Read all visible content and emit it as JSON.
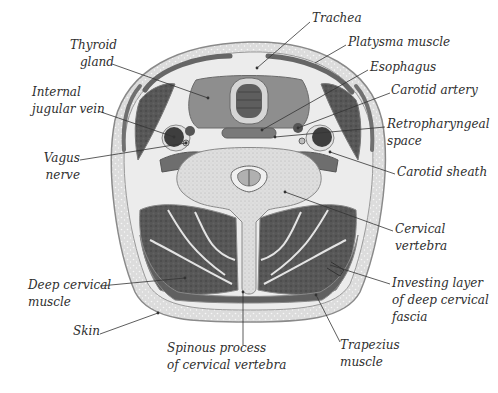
{
  "figure": {
    "colors": {
      "skin": "#cfcfcf",
      "fat": "#e6e6e6",
      "muscle_dark": "#555555",
      "muscle_mid": "#7a7a7a",
      "fascia": "#f2f2f2",
      "bone": "#d9d9d9",
      "outline": "#8a8a8a",
      "label_text": "#2e2e2e",
      "leader_line": "#333333"
    }
  },
  "labels": {
    "trachea": {
      "lines": [
        "Trachea"
      ]
    },
    "thyroid_gland": {
      "lines": [
        "Thyroid",
        "gland"
      ]
    },
    "platysma_muscle": {
      "lines": [
        "Platysma muscle"
      ]
    },
    "esophagus": {
      "lines": [
        "Esophagus"
      ]
    },
    "internal_jugular_vein": {
      "lines": [
        "Internal",
        "jugular vein"
      ]
    },
    "carotid_artery": {
      "lines": [
        "Carotid artery"
      ]
    },
    "retropharyngeal_space": {
      "lines": [
        "Retropharyngeal",
        "space"
      ]
    },
    "vagus_nerve": {
      "lines": [
        "Vagus",
        "nerve"
      ]
    },
    "carotid_sheath": {
      "lines": [
        "Carotid sheath"
      ]
    },
    "cervical_vertebra": {
      "lines": [
        "Cervical",
        "vertebra"
      ]
    },
    "investing_layer": {
      "lines": [
        "Investing layer",
        "of deep cervical",
        "fascia"
      ]
    },
    "deep_cervical_muscle": {
      "lines": [
        "Deep cervical",
        "muscle"
      ]
    },
    "skin": {
      "lines": [
        "Skin"
      ]
    },
    "trapezius_muscle": {
      "lines": [
        "Trapezius",
        "muscle"
      ]
    },
    "spinous_process": {
      "lines": [
        "Spinous process",
        "of cervical vertebra"
      ]
    }
  }
}
